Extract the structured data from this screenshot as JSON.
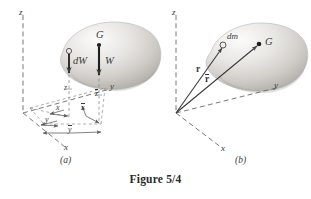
{
  "figure": {
    "caption": "Figure 5/4",
    "panel_a_id": "(a)",
    "panel_b_id": "(b)"
  },
  "panel_a": {
    "axis_z": "z",
    "axis_y": "y",
    "axis_x": "x",
    "point_G": "G",
    "force_dW": "dW",
    "force_W": "W",
    "dim_z_inner": "z",
    "dim_z_bar": "z",
    "dim_x": "x",
    "dim_x_bar": "x",
    "dim_y": "y",
    "dim_y_bar": "y"
  },
  "panel_b": {
    "axis_z": "z",
    "axis_y": "y",
    "axis_x": "x",
    "point_G": "G",
    "mass_element": "dm",
    "vector_r": "r",
    "vector_r_bar": "r"
  },
  "colors": {
    "ink": "#3a3a3a",
    "caption_ink": "#2b2b2b",
    "blob_light": "#f2f1ef",
    "blob_mid": "#d9d7d4",
    "blob_dark": "#b8b5b1",
    "background": "#ffffff"
  }
}
